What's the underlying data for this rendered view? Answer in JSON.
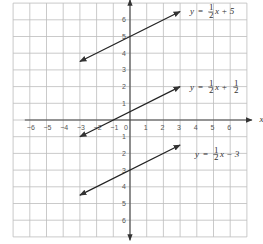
{
  "chart_data": {
    "type": "line",
    "title": "",
    "xlabel": "x",
    "ylabel": "y",
    "xlim": [
      -7,
      7
    ],
    "ylim": [
      -7,
      7
    ],
    "grid": true,
    "x_ticks": [
      "-6",
      "-5",
      "-4",
      "-3",
      "-2",
      "-1",
      "0",
      "1",
      "2",
      "3",
      "4",
      "5",
      "6"
    ],
    "y_ticks": [
      "6",
      "5",
      "4",
      "3",
      "2",
      "1",
      "1",
      "2",
      "3",
      "4",
      "5",
      "6"
    ],
    "series": [
      {
        "name": "y = 1/2x + 5",
        "label_y": "y",
        "label_eq": "=",
        "label_num": "1",
        "label_den": "2",
        "label_rest": "x + 5",
        "slope": 0.5,
        "intercept": 5,
        "x_range": [
          -3,
          3
        ],
        "points": [
          [
            -3,
            3.5
          ],
          [
            3,
            6.5
          ]
        ]
      },
      {
        "name": "y = 1/2x + 1/2",
        "label_y": "y",
        "label_eq": "=",
        "label_num": "1",
        "label_den": "2",
        "label_rest": "x +",
        "label_extra_num": "1",
        "label_extra_den": "2",
        "slope": 0.5,
        "intercept": 0.5,
        "x_range": [
          -3,
          3
        ],
        "points": [
          [
            -3,
            -1
          ],
          [
            3,
            2
          ]
        ]
      },
      {
        "name": "y = 1/2x - 3",
        "label_y": "y",
        "label_eq": "=",
        "label_num": "1",
        "label_den": "2",
        "label_rest": "x − 3",
        "slope": 0.5,
        "intercept": -3,
        "x_range": [
          -3,
          3
        ],
        "points": [
          [
            -3,
            -4.5
          ],
          [
            3,
            -1.5
          ]
        ]
      }
    ]
  }
}
